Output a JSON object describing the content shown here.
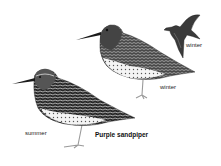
{
  "species": "Purple sandpiper",
  "labels": {
    "summer": "summer",
    "winter_standing": "winter",
    "winter_flying": "winter",
    "caption": "Purple sandpiper"
  },
  "colors": {
    "ink": "#1a1a1a",
    "dark_plumage": "#3a3a3a",
    "mid_plumage": "#6a6a6a",
    "light_plumage": "#d8d8d8",
    "leg": "#9a9a9a",
    "background": "#ffffff"
  }
}
